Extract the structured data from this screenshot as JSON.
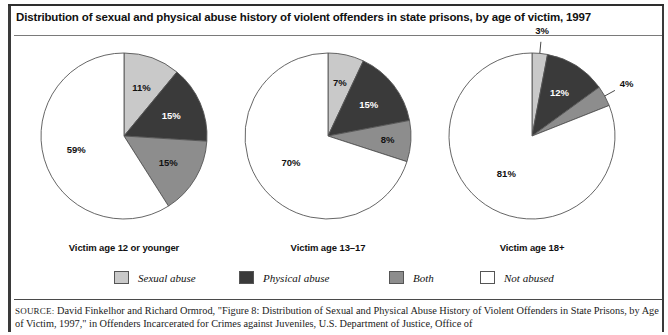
{
  "figure": {
    "title": "Distribution of sexual and physical abuse history of violent offenders in state prisons, by age of victim, 1997",
    "source_label": "SOURCE:",
    "source_text": "David Finkelhor and Richard Ormrod, \"Figure 8: Distribution of Sexual and Physical Abuse History of Violent Offenders in State Prisons, by Age of Victim, 1997,\" in Offenders Incarcerated for Crimes against Juveniles, U.S. Department of Justice, Office of"
  },
  "colors": {
    "sexual_abuse": "#c9c9c9",
    "physical_abuse": "#3a3a3a",
    "both": "#8d8d8d",
    "not_abused": "#ffffff",
    "outline": "#555555"
  },
  "legend": {
    "items": [
      {
        "label": "Sexual abuse",
        "swatch": "#c9c9c9",
        "icon": "legend-swatch-sexual-abuse"
      },
      {
        "label": "Physical abuse",
        "swatch": "#3a3a3a",
        "icon": "legend-swatch-physical-abuse"
      },
      {
        "label": "Both",
        "swatch": "#8d8d8d",
        "icon": "legend-swatch-both"
      },
      {
        "label": "Not abused",
        "swatch": "#ffffff",
        "icon": "legend-swatch-not-abused"
      }
    ]
  },
  "chart_data": {
    "type": "pie",
    "title": "Distribution of sexual and physical abuse history of violent offenders in state prisons, by age of victim, 1997",
    "legend_position": "bottom",
    "categories": [
      "Sexual abuse",
      "Physical abuse",
      "Both",
      "Not abused"
    ],
    "unit": "percent",
    "charts": [
      {
        "title": "Victim age 12 or younger",
        "labels": [
          "11%",
          "15%",
          "15%",
          "59%"
        ],
        "values": [
          11,
          15,
          15,
          59
        ]
      },
      {
        "title": "Victim age 13–17",
        "labels": [
          "7%",
          "15%",
          "8%",
          "70%"
        ],
        "values": [
          7,
          15,
          8,
          70
        ]
      },
      {
        "title": "Victim age 18+",
        "labels": [
          "3%",
          "12%",
          "4%",
          "81%"
        ],
        "values": [
          3,
          12,
          4,
          81
        ]
      }
    ]
  }
}
